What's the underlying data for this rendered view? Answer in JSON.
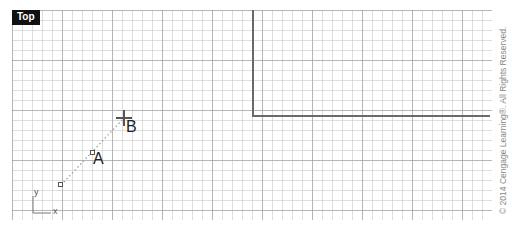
{
  "viewport": {
    "label": "Top"
  },
  "points": [
    {
      "name": "A",
      "label": "A"
    },
    {
      "name": "B",
      "label": "B"
    }
  ],
  "axes": {
    "x_label": "x",
    "y_label": "y"
  },
  "copyright": "© 2014 Cengage Learning®. All Rights Reserved."
}
